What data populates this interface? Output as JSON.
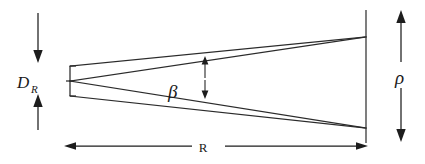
{
  "figure": {
    "type": "technical-line-diagram",
    "background_color": "#ffffff",
    "line_color": "#2b2b2b",
    "label_color": "#1a1a1a"
  },
  "labels": {
    "aperture_diameter": {
      "symbol": "D",
      "subscript": "R",
      "name": "receiver-aperture-diameter",
      "position": "left"
    },
    "divergence_angle": {
      "symbol": "β",
      "name": "beam-divergence-angle",
      "position": "center"
    },
    "spot_radius": {
      "symbol": "ρ",
      "name": "beam-spot-size",
      "position": "right"
    },
    "range": {
      "symbol": "R",
      "name": "range-distance",
      "position": "bottom"
    }
  },
  "geometry": {
    "aperture": {
      "x": 70,
      "y_top": 66,
      "y_bottom": 96,
      "vertex_y": 81
    },
    "screen": {
      "x": 366,
      "y_top": 10,
      "y_bottom": 143,
      "beam_top_y": 37,
      "beam_bottom_y": 128
    },
    "beta_marker": {
      "x": 205,
      "y_top": 57,
      "y_bottom": 98
    },
    "range_dimension": {
      "y": 146,
      "x_start": 66,
      "x_end": 366,
      "gap_start": 192,
      "gap_end": 225
    },
    "aperture_dimension": {
      "x": 38,
      "y_top_arrow_start": 13,
      "y_top_arrow_end": 62,
      "y_bottom_arrow_start": 130,
      "y_bottom_arrow_end": 95
    },
    "spot_dimension": {
      "x": 401,
      "y_top_arrow_start": 62,
      "y_top_arrow_end": 10,
      "y_bottom_arrow_start": 88,
      "y_bottom_arrow_end": 142
    }
  }
}
